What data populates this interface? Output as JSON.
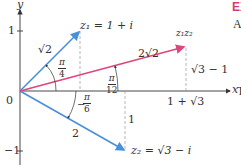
{
  "diagram": {
    "axes": {
      "x_label": "x",
      "y_label": "y",
      "origin_label": "0",
      "y_tick_pos": "1",
      "y_tick_neg": "−1"
    },
    "vectors": {
      "z1": {
        "label": "z₁ = 1 + i",
        "modulus": "√2",
        "angle_num": "π",
        "angle_den": "4",
        "color": "#4a90d9"
      },
      "z2": {
        "label": "z₂ = √3 − i",
        "modulus": "2",
        "angle_num": "π",
        "angle_den": "6",
        "angle_sign": "−",
        "color": "#4a90d9"
      },
      "product": {
        "label": "z₁z₂",
        "modulus": "2√2",
        "angle_num": "π",
        "angle_den": "12",
        "color": "#e0457b"
      }
    },
    "annotations": {
      "product_x": "1 + √3",
      "product_y": "√3 − 1",
      "z2_y": "1"
    }
  },
  "side_text": {
    "heading": "EX",
    "line1": "A",
    "line2": "T"
  }
}
